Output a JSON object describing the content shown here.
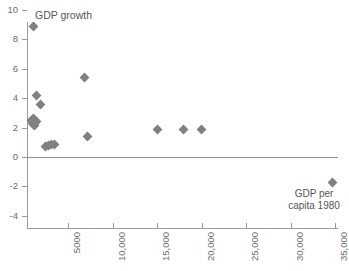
{
  "chart_data": {
    "type": "scatter",
    "title": "",
    "ylabel": "GDP growth",
    "xlabel": "GDP per capita 1980",
    "xlim": [
      0,
      37000
    ],
    "ylim": [
      -4,
      10
    ],
    "grid": false,
    "legend": "none",
    "marker": {
      "shape": "diamond",
      "color": "#808080",
      "size": 7
    },
    "x_ticks": [
      5000,
      10000,
      15000,
      20000,
      25000,
      30000,
      35000
    ],
    "x_tick_labels": [
      "5000",
      "10,000",
      "15,000",
      "20,000",
      "25,000",
      "30,000",
      "35,000"
    ],
    "x_tick_label_rotation": -90,
    "y_ticks": [
      -4,
      -2,
      0,
      2,
      4,
      6,
      8,
      10
    ],
    "y_tick_labels": [
      "-4",
      "-2",
      "0",
      "2",
      "4",
      "6",
      "8",
      "10"
    ],
    "zero_reference_line": 0,
    "points": [
      {
        "x": 1100,
        "y": 8.9
      },
      {
        "x": 1400,
        "y": 4.2
      },
      {
        "x": 1900,
        "y": 3.6
      },
      {
        "x": 800,
        "y": 2.5
      },
      {
        "x": 950,
        "y": 2.3
      },
      {
        "x": 1050,
        "y": 2.6
      },
      {
        "x": 1200,
        "y": 2.15
      },
      {
        "x": 1350,
        "y": 2.4
      },
      {
        "x": 2400,
        "y": 0.7
      },
      {
        "x": 2750,
        "y": 0.8
      },
      {
        "x": 3050,
        "y": 0.85
      },
      {
        "x": 3450,
        "y": 0.85
      },
      {
        "x": 6800,
        "y": 5.4
      },
      {
        "x": 7100,
        "y": 1.4
      },
      {
        "x": 15000,
        "y": 1.85
      },
      {
        "x": 17900,
        "y": 1.85
      },
      {
        "x": 20000,
        "y": 1.85
      },
      {
        "x": 34700,
        "y": -1.7
      }
    ]
  },
  "colors": {
    "marker": "#808080",
    "axis": "#9a9a9a",
    "text": "#5a5a5a",
    "background": "#ffffff"
  }
}
